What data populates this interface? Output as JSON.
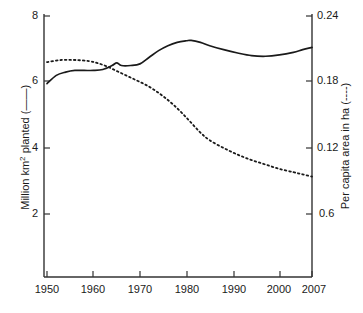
{
  "chart_data": {
    "type": "line",
    "title": "",
    "xlabel": "",
    "ylabel": "Million km2 planted (——)",
    "ylabel_right": "Per capita area in ha (----)",
    "grid": false,
    "legend": "inline-in-axis-labels",
    "xlim": [
      1950,
      2007
    ],
    "ylim": [
      0,
      8
    ],
    "ylim_right": [
      0,
      0.24
    ],
    "x_ticks": [
      "1950",
      "1960",
      "1970",
      "1980",
      "1990",
      "2000",
      "2007"
    ],
    "x_tick_values": [
      1950,
      1960,
      1970,
      1980,
      1990,
      2000,
      2007
    ],
    "y_ticks_left": [
      "8",
      "6",
      "4",
      "2"
    ],
    "y_tick_values_left": [
      8,
      6,
      4,
      2
    ],
    "y_ticks_right": [
      "0.24",
      "0.18",
      "0.12",
      "0.6"
    ],
    "y_tick_values_right": [
      0.24,
      0.18,
      0.12,
      0.06
    ],
    "series": [
      {
        "name": "Million km2 planted",
        "style": "solid",
        "axis": "left",
        "color": "#1a1a1a",
        "x": [
          1950,
          1952,
          1954,
          1956,
          1958,
          1960,
          1962,
          1964,
          1965,
          1966,
          1968,
          1970,
          1972,
          1974,
          1976,
          1978,
          1980,
          1981,
          1983,
          1985,
          1988,
          1991,
          1994,
          1997,
          2000,
          2003,
          2005,
          2007
        ],
        "values": [
          5.95,
          6.2,
          6.3,
          6.35,
          6.35,
          6.35,
          6.38,
          6.5,
          6.58,
          6.5,
          6.5,
          6.55,
          6.75,
          6.95,
          7.1,
          7.2,
          7.25,
          7.26,
          7.2,
          7.1,
          6.98,
          6.88,
          6.8,
          6.78,
          6.82,
          6.9,
          6.98,
          7.05
        ]
      },
      {
        "name": "Per capita area in ha",
        "style": "dashed",
        "axis": "right",
        "color": "#1a1a1a",
        "x": [
          1950,
          1953,
          1956,
          1959,
          1961,
          1963,
          1965,
          1967,
          1969,
          1971,
          1973,
          1975,
          1977,
          1979,
          1981,
          1983,
          1985,
          1988,
          1991,
          1994,
          1997,
          2000,
          2003,
          2005,
          2007
        ],
        "values": [
          0.198,
          0.2,
          0.2,
          0.199,
          0.197,
          0.194,
          0.19,
          0.186,
          0.182,
          0.178,
          0.173,
          0.167,
          0.16,
          0.152,
          0.143,
          0.134,
          0.127,
          0.12,
          0.114,
          0.109,
          0.105,
          0.101,
          0.098,
          0.096,
          0.094
        ]
      }
    ]
  },
  "axes": {
    "left_title": "Million km",
    "left_title_sup": "2",
    "left_title_tail": " planted (——)",
    "right_title": "Per capita area in ha (----)"
  }
}
